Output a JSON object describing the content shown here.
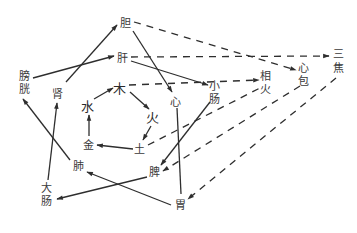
{
  "diagram": {
    "type": "five-elements-organ-relationships",
    "nodes": {
      "dan": {
        "label": "胆",
        "x": 125,
        "y": 23
      },
      "gan": {
        "label": "肝",
        "x": 122,
        "y": 58
      },
      "pangguang": {
        "label": "膀\n胱",
        "x": 25,
        "y": 80
      },
      "shen": {
        "label": "肾",
        "x": 58,
        "y": 94
      },
      "mu": {
        "label": "木",
        "x": 120,
        "y": 88
      },
      "shui": {
        "label": "水",
        "x": 88,
        "y": 106
      },
      "huo": {
        "label": "火",
        "x": 153,
        "y": 118
      },
      "jin": {
        "label": "金",
        "x": 88,
        "y": 144
      },
      "tu": {
        "label": "土",
        "x": 140,
        "y": 149
      },
      "xin": {
        "label": "心",
        "x": 176,
        "y": 101
      },
      "xiaochang": {
        "label": "小\n肠",
        "x": 215,
        "y": 86
      },
      "xianghuo": {
        "label": "相\n火",
        "x": 266,
        "y": 76
      },
      "xinbao": {
        "label": "心\n包",
        "x": 303,
        "y": 68
      },
      "sanjiao": {
        "label": "三\n焦",
        "x": 338,
        "y": 56
      },
      "fei": {
        "label": "肺",
        "x": 80,
        "y": 166
      },
      "pi": {
        "label": "脾",
        "x": 155,
        "y": 172
      },
      "dachang": {
        "label": "大\n肠",
        "x": 46,
        "y": 188
      },
      "wei": {
        "label": "胃",
        "x": 181,
        "y": 206
      }
    },
    "labels": {
      "dan": "胆",
      "gan": "肝",
      "pangguang_1": "膀",
      "pangguang_2": "胱",
      "shen": "肾",
      "mu": "木",
      "shui": "水",
      "huo": "火",
      "jin": "金",
      "tu": "土",
      "xin": "心",
      "xiaochang_1": "小",
      "xiaochang_2": "肠",
      "xianghuo_1": "相",
      "xianghuo_2": "火",
      "xinbao_1": "心",
      "xinbao_2": "包",
      "sanjiao_1": "三",
      "sanjiao_2": "焦",
      "fei": "肺",
      "pi": "脾",
      "dachang_1": "大",
      "dachang_2": "肠",
      "wei": "胃"
    },
    "edges": [
      {
        "from": "shen",
        "to": "dan",
        "style": "solid",
        "arrow": "end"
      },
      {
        "from": "pangguang",
        "to": "gan",
        "style": "solid",
        "arrow": "end"
      },
      {
        "from": "dan",
        "to": "xin",
        "style": "solid",
        "arrow": "end"
      },
      {
        "from": "gan",
        "to": "xiaochang",
        "style": "solid",
        "arrow": "end"
      },
      {
        "from": "xin",
        "to": "wei",
        "style": "solid",
        "arrow": "none"
      },
      {
        "from": "xiaochang",
        "to": "pi",
        "style": "solid",
        "arrow": "end"
      },
      {
        "from": "pi",
        "to": "dachang",
        "style": "solid",
        "arrow": "end"
      },
      {
        "from": "wei",
        "to": "fei",
        "style": "solid",
        "arrow": "end"
      },
      {
        "from": "fei",
        "to": "pangguang",
        "style": "solid",
        "arrow": "end"
      },
      {
        "from": "dachang",
        "to": "shen",
        "style": "solid",
        "arrow": "end"
      },
      {
        "from": "shui",
        "to": "mu",
        "style": "solid",
        "arrow": "end"
      },
      {
        "from": "mu",
        "to": "huo",
        "style": "solid",
        "arrow": "end"
      },
      {
        "from": "huo",
        "to": "tu",
        "style": "solid",
        "arrow": "end"
      },
      {
        "from": "tu",
        "to": "jin",
        "style": "solid",
        "arrow": "end"
      },
      {
        "from": "jin",
        "to": "shui",
        "style": "solid",
        "arrow": "end"
      },
      {
        "from": "dan",
        "to": "xinbao",
        "style": "dashed",
        "arrow": "end"
      },
      {
        "from": "gan",
        "to": "sanjiao",
        "style": "dashed",
        "arrow": "end"
      },
      {
        "from": "mu",
        "to": "xianghuo",
        "style": "dashed",
        "arrow": "end"
      },
      {
        "from": "tu",
        "to": "xianghuo",
        "style": "dashed",
        "arrow": "none"
      },
      {
        "from": "xinbao",
        "to": "pi",
        "style": "dashed",
        "arrow": "end"
      },
      {
        "from": "sanjiao",
        "to": "wei",
        "style": "dashed",
        "arrow": "end"
      }
    ]
  }
}
